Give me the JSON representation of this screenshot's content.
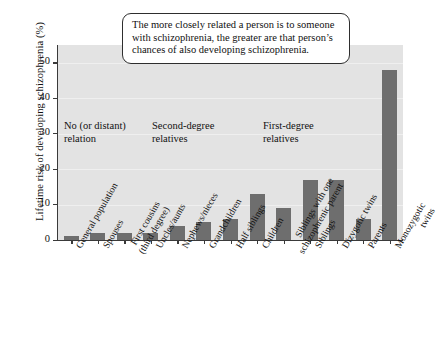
{
  "chart_data": {
    "type": "bar",
    "title": "",
    "xlabel": "",
    "ylabel": "Lifetime risk of developing schizophrenia (%)",
    "ylim": [
      0,
      55
    ],
    "yticks": [
      0,
      10,
      20,
      30,
      40,
      50
    ],
    "grid": true,
    "legend": "none",
    "bar_color": "#6e6e6e",
    "plot_background": "#e3e3e3",
    "categories": [
      "General population",
      "Spouses",
      "First cousins\n(third degree)",
      "Uncles/aunts",
      "Nephews/nieces",
      "Grandchildren",
      "Half siblings",
      "Children",
      "Siblings with one\nschizophrenic parent",
      "Siblings",
      "Dizygotic twins",
      "Parents",
      "Monozygotic twins"
    ],
    "values": [
      1,
      2,
      2,
      2,
      4,
      5,
      6,
      13,
      9,
      17,
      17,
      6,
      48
    ],
    "annotations": [
      "No (or distant)\nrelation",
      "Second-degree\nrelatives",
      "First-degree\nrelatives"
    ],
    "callout": "The more closely related a person is to someone with schizophrenia, the greater are that person’s chances of also developing schizophrenia."
  }
}
